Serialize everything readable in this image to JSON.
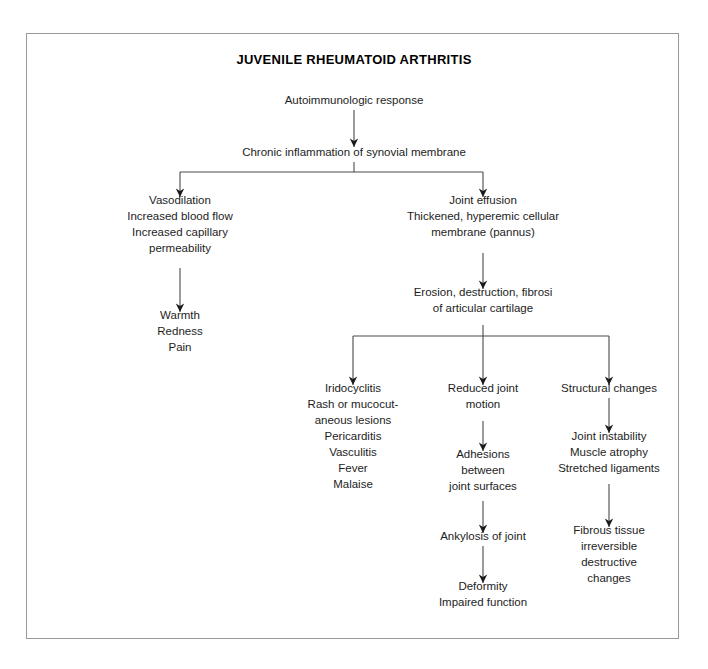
{
  "diagram": {
    "title": "JUVENILE RHEUMATOID ARTHRITIS",
    "frame_color": "#9a9a9a",
    "text_color": "#1d1d1d",
    "connector_color": "#4a4a4a",
    "background": "#ffffff"
  },
  "nodes": {
    "autoimmune": {
      "lines": [
        "Autoimmunologic response"
      ],
      "cx": 354,
      "top": 104
    },
    "chronic": {
      "lines": [
        "Chronic inflammation of synovial membrane"
      ],
      "cx": 354,
      "top": 156
    },
    "vasodilation": {
      "lines": [
        "Vasodilation",
        "Increased blood flow",
        "Increased capillary",
        "permeability"
      ],
      "cx": 180,
      "top": 204
    },
    "warmth": {
      "lines": [
        "Warmth",
        "Redness",
        "Pain"
      ],
      "cx": 180,
      "top": 319
    },
    "effusion": {
      "lines": [
        "Joint effusion",
        "Thickened, hyperemic cellular",
        "membrane (pannus)"
      ],
      "cx": 483,
      "top": 204
    },
    "erosion": {
      "lines": [
        "Erosion, destruction, fibrosi",
        "of articular cartilage"
      ],
      "cx": 483,
      "top": 296
    },
    "iridocyclitis": {
      "lines": [
        "Iridocyclitis",
        "Rash or mucocut-",
        "aneous lesions",
        "Pericarditis",
        "Vasculitis",
        "Fever",
        "Malaise"
      ],
      "cx": 353,
      "top": 392
    },
    "reduced_motion": {
      "lines": [
        "Reduced joint",
        "motion"
      ],
      "cx": 483,
      "top": 392
    },
    "adhesions": {
      "lines": [
        "Adhesions",
        "between",
        "joint surfaces"
      ],
      "cx": 483,
      "top": 458
    },
    "ankylosis": {
      "lines": [
        "Ankylosis of joint"
      ],
      "cx": 483,
      "top": 540
    },
    "deformity": {
      "lines": [
        "Deformity",
        "Impaired function"
      ],
      "cx": 483,
      "top": 590
    },
    "structural": {
      "lines": [
        "Structural changes"
      ],
      "cx": 609,
      "top": 392
    },
    "instability": {
      "lines": [
        "Joint instability",
        "Muscle atrophy",
        "Stretched ligaments"
      ],
      "cx": 609,
      "top": 440
    },
    "fibrous": {
      "lines": [
        "Fibrous tissue",
        "irreversible",
        "destructive",
        "changes"
      ],
      "cx": 609,
      "top": 534
    }
  },
  "connectors": [
    {
      "name": "autoimmune-to-chronic",
      "type": "arrow",
      "x": 354,
      "y1": 110,
      "y2": 147
    },
    {
      "name": "chronic-split-stub",
      "type": "line",
      "x": 354,
      "y1": 162,
      "y2": 172
    },
    {
      "name": "chronic-split-bar",
      "type": "hbar",
      "y": 172,
      "x1": 180,
      "x2": 483
    },
    {
      "name": "split-left-arm",
      "type": "arrow",
      "x": 180,
      "y1": 172,
      "y2": 197
    },
    {
      "name": "split-right-arm",
      "type": "arrow",
      "x": 483,
      "y1": 172,
      "y2": 197
    },
    {
      "name": "vasodilation-to-warmth",
      "type": "arrow",
      "x": 180,
      "y1": 268,
      "y2": 312
    },
    {
      "name": "effusion-to-erosion",
      "type": "arrow",
      "x": 483,
      "y1": 253,
      "y2": 289
    },
    {
      "name": "erosion-split-stub",
      "type": "line",
      "x": 483,
      "y1": 325,
      "y2": 336
    },
    {
      "name": "erosion-split-bar",
      "type": "hbar",
      "y": 336,
      "x1": 353,
      "x2": 609
    },
    {
      "name": "triple-left-arm",
      "type": "arrow",
      "x": 353,
      "y1": 336,
      "y2": 385
    },
    {
      "name": "triple-mid-arm",
      "type": "arrow",
      "x": 483,
      "y1": 336,
      "y2": 385
    },
    {
      "name": "triple-right-arm",
      "type": "arrow",
      "x": 609,
      "y1": 336,
      "y2": 385
    },
    {
      "name": "motion-to-adhesions",
      "type": "arrow",
      "x": 483,
      "y1": 421,
      "y2": 451
    },
    {
      "name": "adhesions-to-ankylosis",
      "type": "arrow",
      "x": 483,
      "y1": 501,
      "y2": 533
    },
    {
      "name": "ankylosis-to-deformity",
      "type": "arrow",
      "x": 483,
      "y1": 546,
      "y2": 583
    },
    {
      "name": "structural-to-instability",
      "type": "arrow",
      "x": 609,
      "y1": 398,
      "y2": 433
    },
    {
      "name": "instability-to-fibrous",
      "type": "arrow",
      "x": 609,
      "y1": 484,
      "y2": 527
    }
  ],
  "layout": {
    "title_cx": 354,
    "title_baseline": 64,
    "line_height": 16
  }
}
